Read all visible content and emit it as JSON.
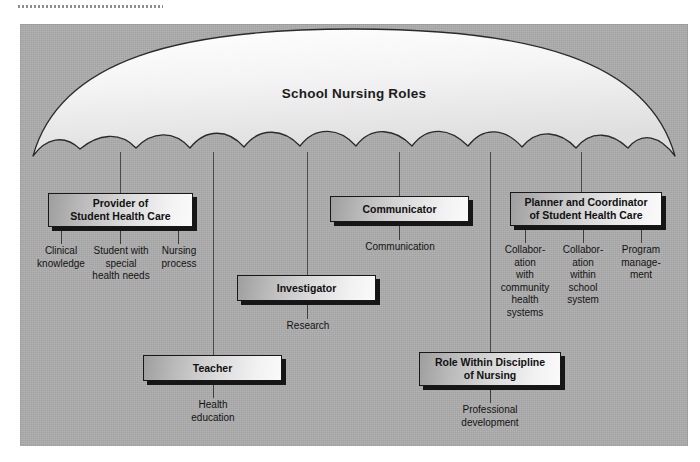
{
  "diagram": {
    "umbrella_title": "School Nursing Roles",
    "colors": {
      "panel_bg": "#adadad",
      "canopy_light": "#f7f7f7",
      "outline": "#2a2a2a",
      "box_shadow": "#161616",
      "text": "#111111"
    },
    "scanline": "dotted-scan-line"
  },
  "nodes": [
    {
      "id": "provider",
      "title": "Provider of\nStudent Health Care",
      "title_lines": [
        "Provider of",
        "Student Health Care"
      ],
      "leaves": [
        {
          "lines": [
            "Clinical",
            "knowledge"
          ]
        },
        {
          "lines": [
            "Student with",
            "special",
            "health needs"
          ]
        },
        {
          "lines": [
            "Nursing",
            "process"
          ]
        }
      ]
    },
    {
      "id": "communicator",
      "title": "Communicator",
      "title_lines": [
        "Communicator"
      ],
      "leaves": [
        {
          "lines": [
            "Communication"
          ]
        }
      ]
    },
    {
      "id": "planner",
      "title": "Planner and Coordinator of Student Health Care",
      "title_lines": [
        "Planner and Coordinator",
        "of Student Health Care"
      ],
      "leaves": [
        {
          "lines": [
            "Collabor-",
            "ation",
            "with",
            "community",
            "health",
            "systems"
          ]
        },
        {
          "lines": [
            "Collabor-",
            "ation",
            "within",
            "school",
            "system"
          ]
        },
        {
          "lines": [
            "Program",
            "manage-",
            "ment"
          ]
        }
      ]
    },
    {
      "id": "investigator",
      "title": "Investigator",
      "title_lines": [
        "Investigator"
      ],
      "leaves": [
        {
          "lines": [
            "Research"
          ]
        }
      ]
    },
    {
      "id": "teacher",
      "title": "Teacher",
      "title_lines": [
        "Teacher"
      ],
      "leaves": [
        {
          "lines": [
            "Health",
            "education"
          ]
        }
      ]
    },
    {
      "id": "role-within-discipline",
      "title": "Role Within Discipline of Nursing",
      "title_lines": [
        "Role Within Discipline",
        "of Nursing"
      ],
      "leaves": [
        {
          "lines": [
            "Professional",
            "development"
          ]
        }
      ]
    }
  ]
}
